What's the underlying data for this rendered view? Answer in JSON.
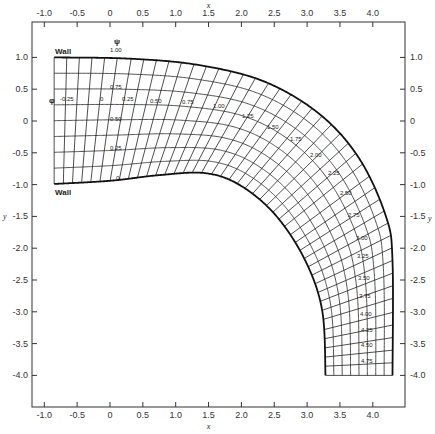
{
  "chart_data": {
    "type": "line",
    "xlabel": "x",
    "ylabel": "y",
    "xlim": [
      -1.2,
      4.4
    ],
    "ylim": [
      -4.5,
      1.45
    ],
    "x_ticks": [
      -1.0,
      -0.5,
      0,
      0.5,
      1.0,
      1.5,
      2.0,
      2.5,
      3.0,
      3.5,
      4.0
    ],
    "x_tick_labels": [
      "-1.0",
      "-0.5",
      "0",
      "0.5",
      "1.0",
      "1.5",
      "2.0",
      "2.5",
      "3.0",
      "3.5",
      "4.0"
    ],
    "y_ticks": [
      1.0,
      0.5,
      0,
      -0.5,
      -1.0,
      -1.5,
      -2.0,
      -2.5,
      -3.0,
      -3.5,
      -4.0
    ],
    "y_tick_labels": [
      "1.0",
      "0.5",
      "0",
      "-0.5",
      "-1.0",
      "-1.5",
      "-2.0",
      "-2.5",
      "-3.0",
      "-3.5",
      "-4.0"
    ],
    "grid": false,
    "walls": [
      {
        "label": "Wall",
        "position": "outer",
        "psi": 1.0
      },
      {
        "label": "Wall",
        "position": "inner",
        "psi": 0
      }
    ],
    "psi_symbol": "ψ",
    "phi_symbol": "φ",
    "psi_labels": [
      "1.00",
      "0.75",
      "0.50",
      "0.25",
      "0"
    ],
    "phi_labels": [
      "-0.25",
      "0",
      "0.25",
      "0.50",
      "0.75",
      "1.00",
      "1.25",
      "1.50",
      "1.75",
      "2.00",
      "2.25",
      "2.50",
      "2.75",
      "3.00",
      "3.25",
      "3.50",
      "3.75",
      "4.00",
      "4.25",
      "4.50",
      "4.75"
    ],
    "series": [
      {
        "name": "outer wall (psi=1.00)",
        "x": [
          -0.85,
          0.3,
          1.35,
          2.35,
          3.2,
          3.8,
          4.2,
          4.3,
          4.3
        ],
        "y": [
          1.0,
          0.98,
          0.88,
          0.62,
          0.1,
          -0.6,
          -1.5,
          -2.2,
          -4.0
        ]
      },
      {
        "name": "inner wall (psi=0)",
        "x": [
          -0.85,
          0.0,
          0.76,
          1.45,
          1.98,
          2.52,
          2.97,
          3.23,
          3.28
        ],
        "y": [
          -0.99,
          -0.94,
          -0.85,
          -0.82,
          -1.01,
          -1.48,
          -2.19,
          -2.98,
          -4.0
        ]
      }
    ],
    "axis_labels": {
      "top_x": "x",
      "bottom_x": "x",
      "left_y": "y",
      "right_y": "y"
    }
  },
  "labels": {
    "wall_top": "Wall",
    "wall_bottom": "Wall",
    "psi": "ψ",
    "phi": "φ"
  }
}
